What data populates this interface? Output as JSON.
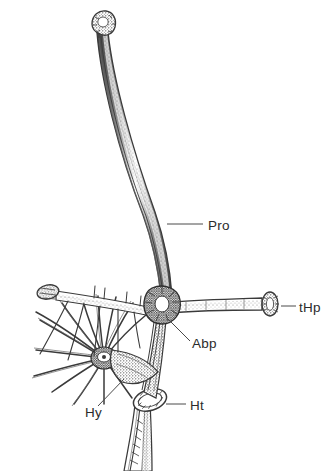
{
  "figure": {
    "background_color": "#ffffff",
    "ink_color": "#3a3a3a",
    "label_color": "#2b2b2b",
    "leader_color": "#4a4a4a",
    "width": 331,
    "height": 471,
    "style": "scanned halftone scientific line drawing"
  },
  "labels": [
    {
      "id": "pro",
      "text": "Pro",
      "x": 208,
      "y": 230,
      "leader": {
        "x1": 167,
        "y1": 224,
        "x2": 203,
        "y2": 224
      }
    },
    {
      "id": "thp",
      "text": "tHp",
      "x": 299,
      "y": 312,
      "leader": {
        "x1": 281,
        "y1": 306,
        "x2": 296,
        "y2": 306
      }
    },
    {
      "id": "abp",
      "text": "Abp",
      "x": 192,
      "y": 348,
      "leader": {
        "x1": 166,
        "y1": 317,
        "x2": 190,
        "y2": 341
      }
    },
    {
      "id": "hy",
      "text": "Hy",
      "x": 85,
      "y": 417,
      "leader": {
        "x1": 124,
        "y1": 379,
        "x2": 98,
        "y2": 406
      }
    },
    {
      "id": "ht",
      "text": "Ht",
      "x": 190,
      "y": 410,
      "leader": {
        "x1": 166,
        "y1": 404,
        "x2": 186,
        "y2": 404
      }
    }
  ],
  "structures": [
    {
      "id": "pro-shaft",
      "name": "Pro",
      "description": "long curved striated rod rising from central junction to upper left, terminating in a knobbed bulbous apex"
    },
    {
      "id": "pro-apex",
      "name": "Pro apex",
      "description": "bulbous knobbed tip at top of the long rod"
    },
    {
      "id": "thp-arm",
      "name": "tHp",
      "description": "horizontal arm extending right from the junction ending in a flared disc-shaped knob"
    },
    {
      "id": "left-arm",
      "name": "left arm",
      "description": "arm extending left from junction with flared terminal knob and small dorsal bristles"
    },
    {
      "id": "abp-junction",
      "name": "Abp",
      "description": "dark stippled central junction where arms converge"
    },
    {
      "id": "hy-fan",
      "name": "Hy",
      "description": "radiating fan of long tapering bristles from a dark stippled hub at lower left"
    },
    {
      "id": "ht-ring",
      "name": "Ht",
      "description": "elliptical hatched ring collar at the base of the stem"
    },
    {
      "id": "basal-stem",
      "name": "basal stem",
      "description": "striated stem descending below the ring to the bottom edge"
    }
  ]
}
